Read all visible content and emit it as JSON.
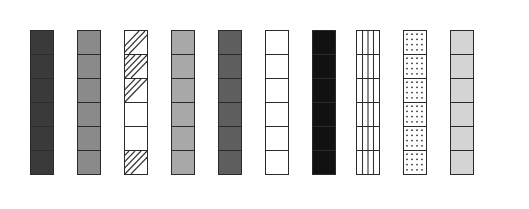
{
  "figure": {
    "cells_per_column": 6,
    "columns": [
      {
        "id": 1,
        "x": 30,
        "fill": "#3a3a3a",
        "pattern": "solid-dark"
      },
      {
        "id": 2,
        "x": 77,
        "fill": "#8a8a8a",
        "pattern": "solid-medium"
      },
      {
        "id": 3,
        "x": 124,
        "fill": "#ffffff",
        "pattern": "partial-diagonal-hatch",
        "hatched_cells": [
          1,
          2,
          3,
          6
        ]
      },
      {
        "id": 4,
        "x": 171,
        "fill": "#a8a8a8",
        "pattern": "solid-light-medium"
      },
      {
        "id": 5,
        "x": 218,
        "fill": "#5e5e5e",
        "pattern": "solid-medium-dark"
      },
      {
        "id": 6,
        "x": 265,
        "fill": "#ffffff",
        "pattern": "empty"
      },
      {
        "id": 7,
        "x": 312,
        "fill": "#111111",
        "pattern": "solid-black"
      },
      {
        "id": 8,
        "x": 356,
        "fill": "#ffffff",
        "pattern": "vertical-lines"
      },
      {
        "id": 9,
        "x": 403,
        "fill": "#ffffff",
        "pattern": "dots"
      },
      {
        "id": 10,
        "x": 450,
        "fill": "#d4d4d4",
        "pattern": "solid-light"
      }
    ]
  }
}
